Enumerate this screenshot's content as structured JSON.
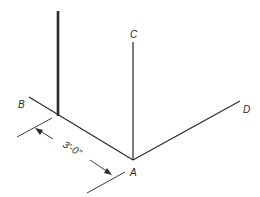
{
  "diagram": {
    "type": "isometric-layout",
    "colors": {
      "line": "#2a2a2a",
      "background": "#ffffff"
    },
    "points": {
      "A": {
        "label": "A"
      },
      "B": {
        "label": "B"
      },
      "C": {
        "label": "C"
      },
      "D": {
        "label": "D"
      }
    },
    "dimension": {
      "text": "3'-0\""
    },
    "elements": [
      {
        "name": "post",
        "description": "thick vertical member rising from line A-B"
      },
      {
        "name": "line-AB"
      },
      {
        "name": "line-AC"
      },
      {
        "name": "line-AD"
      }
    ]
  }
}
